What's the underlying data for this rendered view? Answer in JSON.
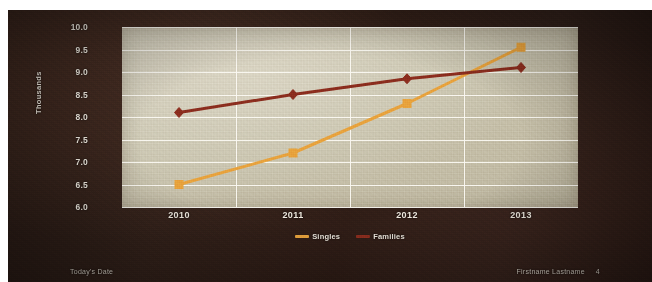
{
  "slide": {
    "background_color": "#2b1c16",
    "plot_background_color": "#cfcab6",
    "gridline_color": "#fbf9f2",
    "text_color": "#efe9df"
  },
  "footer": {
    "date_label": "Today's Date",
    "author_label": "Firstname Lastname",
    "page_number": "4"
  },
  "chart_data": {
    "type": "line",
    "title": "",
    "xlabel": "",
    "ylabel": "Thousands",
    "categories": [
      "2010",
      "2011",
      "2012",
      "2013"
    ],
    "ylim": [
      6.0,
      10.0
    ],
    "ytick_step": 0.5,
    "yticks": [
      "10.0",
      "9.5",
      "9.0",
      "8.5",
      "8.0",
      "7.5",
      "7.0",
      "6.5",
      "6.0"
    ],
    "grid": true,
    "legend_position": "bottom",
    "series": [
      {
        "name": "Singles",
        "color": "#e8a33d",
        "marker": "square",
        "values": [
          6.5,
          7.2,
          8.3,
          9.55
        ]
      },
      {
        "name": "Families",
        "color": "#8c2d1e",
        "marker": "diamond",
        "values": [
          8.1,
          8.5,
          8.85,
          9.1
        ]
      }
    ]
  }
}
